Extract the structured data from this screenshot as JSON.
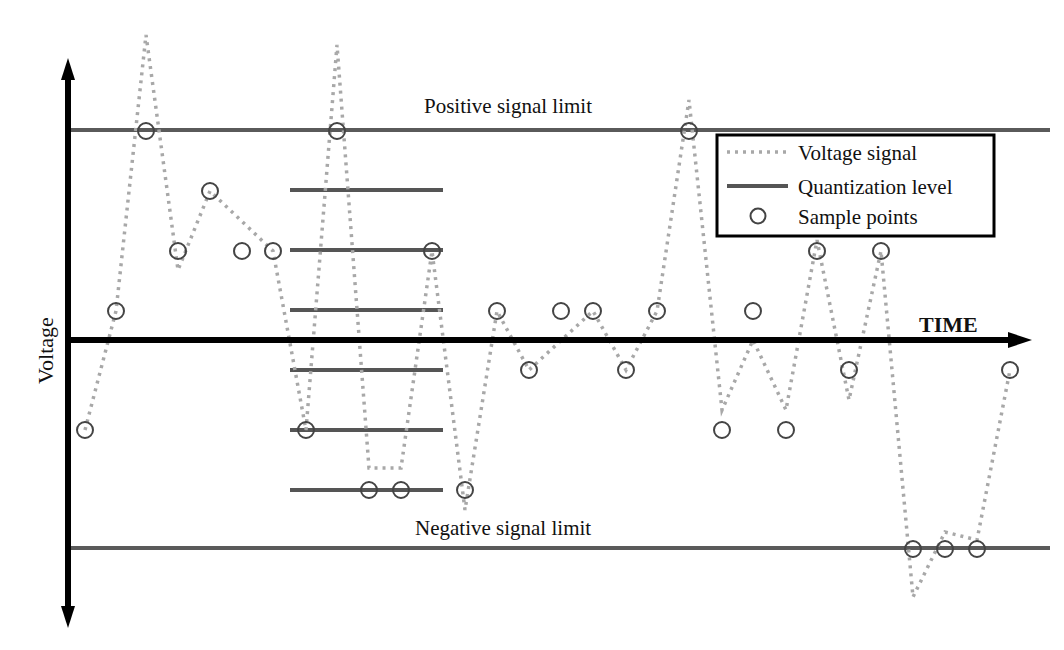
{
  "labels": {
    "positive_limit": "Positive signal limit",
    "negative_limit": "Negative signal limit",
    "x_axis": "TIME",
    "y_axis": "Voltage"
  },
  "legend": {
    "items": [
      {
        "label": "Voltage signal",
        "symbol": "dotted-line"
      },
      {
        "label": "Quantization level",
        "symbol": "solid-line"
      },
      {
        "label": "Sample points",
        "symbol": "circle"
      }
    ]
  },
  "colors": {
    "axis": "#000000",
    "limit_line": "#5a5a5a",
    "quantization_line": "#555555",
    "signal": "#a8a8a8",
    "sample_stroke": "#444444",
    "text": "#111111"
  },
  "geometry": {
    "y_axis_x": 68,
    "y_axis_top": 58,
    "y_axis_bottom": 628,
    "x_axis_y": 340,
    "x_axis_left": 68,
    "x_axis_right": 1032,
    "positive_limit_y": 130,
    "negative_limit_y": 548,
    "limit_x_start": 70,
    "limit_x_end": 1050,
    "quantization_x_start": 290,
    "quantization_x_end": 443,
    "quantization_levels_y": [
      190,
      250,
      310,
      370,
      430,
      490
    ]
  },
  "signal_path": [
    [
      85,
      430
    ],
    [
      116,
      311
    ],
    [
      146,
      35
    ],
    [
      178,
      270
    ],
    [
      210,
      191
    ],
    [
      273,
      251
    ],
    [
      306,
      430
    ],
    [
      337,
      45
    ],
    [
      369,
      468
    ],
    [
      401,
      468
    ],
    [
      432,
      251
    ],
    [
      465,
      510
    ],
    [
      497,
      311
    ],
    [
      529,
      370
    ],
    [
      593,
      311
    ],
    [
      626,
      370
    ],
    [
      657,
      311
    ],
    [
      689,
      100
    ],
    [
      722,
      410
    ],
    [
      753,
      340
    ],
    [
      786,
      410
    ],
    [
      817,
      240
    ],
    [
      849,
      400
    ],
    [
      881,
      251
    ],
    [
      913,
      597
    ],
    [
      945,
      532
    ],
    [
      977,
      540
    ],
    [
      1010,
      370
    ]
  ],
  "sample_points": [
    [
      85,
      430
    ],
    [
      116,
      311
    ],
    [
      146,
      131
    ],
    [
      178,
      251
    ],
    [
      210,
      191
    ],
    [
      242,
      251
    ],
    [
      273,
      251
    ],
    [
      306,
      430
    ],
    [
      337,
      131
    ],
    [
      369,
      490
    ],
    [
      401,
      490
    ],
    [
      432,
      251
    ],
    [
      465,
      490
    ],
    [
      497,
      311
    ],
    [
      529,
      370
    ],
    [
      561,
      311
    ],
    [
      593,
      311
    ],
    [
      626,
      370
    ],
    [
      657,
      311
    ],
    [
      689,
      131
    ],
    [
      722,
      430
    ],
    [
      753,
      311
    ],
    [
      786,
      430
    ],
    [
      817,
      251
    ],
    [
      849,
      370
    ],
    [
      881,
      251
    ],
    [
      913,
      549
    ],
    [
      945,
      549
    ],
    [
      977,
      549
    ],
    [
      1010,
      370
    ]
  ]
}
